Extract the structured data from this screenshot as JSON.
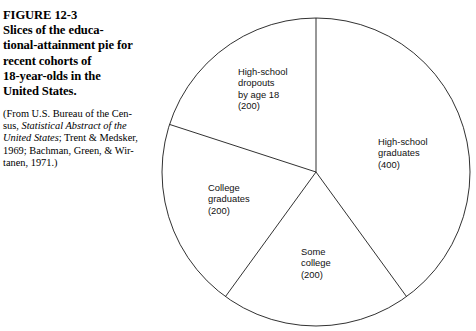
{
  "figure": {
    "number": "FIGURE 12-3",
    "title_lines": [
      "FIGURE 12-3",
      "Slices of the educa-",
      "tional-attainment pie for",
      "recent cohorts of",
      "18-year-olds in the",
      "United States."
    ],
    "source_lines": [
      "(From U.S. Bureau of the Cen-",
      "sus, Statistical Abstract of the",
      "United States; Trent & Medsker,",
      "1969; Bachman, Green, & Wir-",
      "tanen, 1971.)"
    ],
    "source_italic_text": "Statistical Abstract of the United States"
  },
  "chart_data": {
    "type": "pie",
    "total": 1000,
    "units": "persons per 1000",
    "start_angle_deg": 0,
    "direction": "clockwise",
    "grid": false,
    "legend": "none",
    "labels_inline": true,
    "fill": "#ffffff",
    "stroke": "#000000",
    "categories": [
      "High-school graduates",
      "Some college",
      "College graduates",
      "High-school dropouts by age 18"
    ],
    "values": [
      400,
      200,
      200,
      200
    ],
    "percentages": [
      40,
      20,
      20,
      20
    ],
    "slices": [
      {
        "name": "high-school-graduates",
        "label_lines": [
          "High-school",
          "graduates",
          "(400)"
        ],
        "value": 400,
        "start_deg": 0,
        "end_deg": 144,
        "label_x": 378,
        "label_y": 145
      },
      {
        "name": "some-college",
        "label_lines": [
          "Some",
          "college",
          "(200)"
        ],
        "value": 200,
        "start_deg": 144,
        "end_deg": 216,
        "label_x": 301,
        "label_y": 255
      },
      {
        "name": "college-graduates",
        "label_lines": [
          "College",
          "graduates",
          "(200)"
        ],
        "value": 200,
        "start_deg": 216,
        "end_deg": 288,
        "label_x": 208,
        "label_y": 191
      },
      {
        "name": "high-school-dropouts",
        "label_lines": [
          "High-school",
          "dropouts",
          "by age 18",
          "(200)"
        ],
        "value": 200,
        "start_deg": 288,
        "end_deg": 360,
        "label_x": 238,
        "label_y": 75
      }
    ],
    "geometry": {
      "center_x": 316,
      "center_y": 172,
      "radius": 154
    }
  }
}
